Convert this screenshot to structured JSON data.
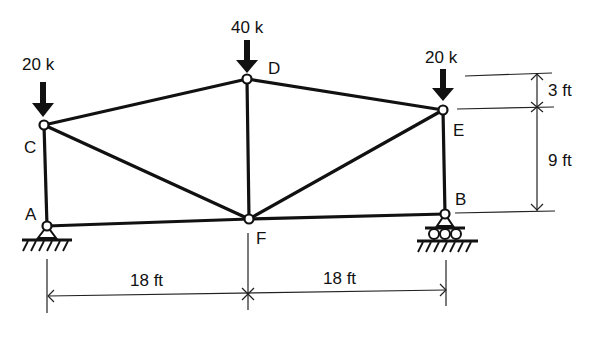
{
  "diagram": {
    "type": "truss",
    "joints": [
      {
        "id": "A",
        "label": "A",
        "x": 47,
        "y": 226
      },
      {
        "id": "B",
        "label": "B",
        "x": 445,
        "y": 214
      },
      {
        "id": "C",
        "label": "C",
        "x": 44,
        "y": 125
      },
      {
        "id": "D",
        "label": "D",
        "x": 247,
        "y": 79
      },
      {
        "id": "E",
        "label": "E",
        "x": 443,
        "y": 110
      },
      {
        "id": "F",
        "label": "F",
        "x": 249,
        "y": 219
      }
    ],
    "members": [
      [
        "A",
        "C"
      ],
      [
        "A",
        "F"
      ],
      [
        "F",
        "B"
      ],
      [
        "B",
        "E"
      ],
      [
        "C",
        "D"
      ],
      [
        "D",
        "E"
      ],
      [
        "C",
        "F"
      ],
      [
        "D",
        "F"
      ],
      [
        "E",
        "F"
      ]
    ],
    "loads": [
      {
        "joint": "C",
        "label": "20 k"
      },
      {
        "joint": "D",
        "label": "40 k"
      },
      {
        "joint": "E",
        "label": "20 k"
      }
    ],
    "supports": [
      {
        "joint": "A",
        "type": "pin"
      },
      {
        "joint": "B",
        "type": "roller"
      }
    ],
    "dimensions": {
      "horizontal": [
        {
          "from": "A",
          "to": "F",
          "label": "18 ft"
        },
        {
          "from": "F",
          "to": "B",
          "label": "18 ft"
        }
      ],
      "vertical": [
        {
          "from": "D-level",
          "to": "E",
          "label": "3 ft"
        },
        {
          "from": "E",
          "to": "B",
          "label": "9 ft"
        }
      ]
    }
  }
}
